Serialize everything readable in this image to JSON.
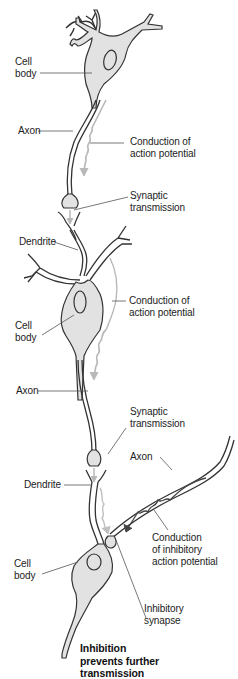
{
  "diagram": {
    "type": "neuron-signal-transmission",
    "colors": {
      "outline": "#333333",
      "cell_fill": "#e2e2e2",
      "signal_arrow": "#b8b8b8",
      "inhibitory_arrow": "#444444",
      "leader_line": "#555555",
      "text": "#222222"
    },
    "labels": {
      "cell_body_1": [
        "Cell",
        "body"
      ],
      "axon_1": "Axon",
      "conduction_1": [
        "Conduction of",
        "action potential"
      ],
      "synaptic_1": [
        "Synaptic",
        "transmission"
      ],
      "dendrite_2": "Dendrite",
      "conduction_2": [
        "Conduction of",
        "action potential"
      ],
      "cell_body_2": [
        "Cell",
        "body"
      ],
      "axon_2": "Axon",
      "synaptic_2": [
        "Synaptic",
        "transmission"
      ],
      "axon_inhibitory": "Axon",
      "dendrite_3": "Dendrite",
      "conduction_inhibitory": [
        "Conduction",
        "of inhibitory",
        "action potential"
      ],
      "cell_body_3": [
        "Cell",
        "body"
      ],
      "inhibitory_synapse": [
        "Inhibitory",
        "synapse"
      ],
      "conclusion": [
        "Inhibition",
        "prevents further",
        "transmission"
      ]
    }
  }
}
